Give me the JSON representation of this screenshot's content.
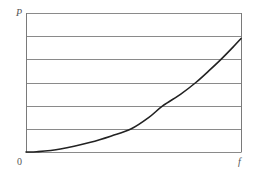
{
  "chart_data": {
    "type": "line",
    "title": "",
    "xlabel": "f",
    "ylabel": "P",
    "origin_label": "0",
    "xlim": [
      0,
      1
    ],
    "ylim": [
      0,
      6
    ],
    "grid": {
      "horizontal": true,
      "vertical": false,
      "horizontal_lines": [
        0,
        1,
        2,
        3,
        4,
        5,
        6
      ]
    },
    "legend": null,
    "series": [
      {
        "name": "P(f)",
        "color": "#222222",
        "x": [
          0.0,
          0.05,
          0.16,
          0.3,
          0.4,
          0.49,
          0.57,
          0.637,
          0.72,
          0.79,
          0.85,
          0.907,
          0.955,
          1.0
        ],
        "y": [
          0.0,
          0.01,
          0.13,
          0.42,
          0.7,
          1.0,
          1.48,
          2.0,
          2.5,
          3.0,
          3.5,
          4.0,
          4.45,
          4.9
        ]
      }
    ],
    "colors": {
      "frame": "#7a7a7a",
      "grid": "#8a8a8a",
      "curve": "#222222",
      "text": "#555555"
    }
  }
}
